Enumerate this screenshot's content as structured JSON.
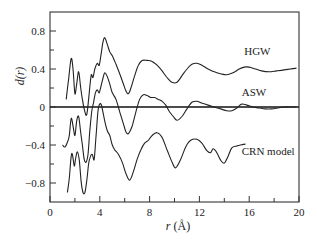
{
  "chart_data": {
    "type": "line",
    "title": "",
    "xlabel": "r (Å)",
    "ylabel": "d(r)",
    "xlim": [
      0,
      20
    ],
    "ylim": [
      -1.0,
      1.0
    ],
    "grid": false,
    "legend": "inline labels",
    "x_ticks": [
      0,
      4,
      8,
      12,
      16,
      20
    ],
    "x_tick_labels": [
      "0",
      "4",
      "8",
      "12",
      "16",
      "20"
    ],
    "x_minor_ticks": [
      2,
      6,
      10,
      14,
      18
    ],
    "y_ticks": [
      0.8,
      0.4,
      0,
      -0.4,
      -0.8
    ],
    "y_tick_labels": [
      "0.8",
      "0.4",
      "0",
      "−0.4",
      "−0.8"
    ],
    "y_minor_ticks": [
      0.6,
      0.2,
      -0.2,
      -0.6
    ],
    "zero_line": true,
    "series": [
      {
        "name": "HGW",
        "label_pos": [
          15.6,
          0.55
        ],
        "x": [
          1.3,
          1.5,
          1.7,
          1.85,
          2.0,
          2.15,
          2.3,
          2.45,
          2.6,
          2.8,
          2.95,
          3.1,
          3.3,
          3.45,
          3.6,
          3.8,
          3.95,
          4.1,
          4.25,
          4.4,
          4.6,
          4.8,
          5.0,
          5.3,
          5.6,
          5.9,
          6.1,
          6.3,
          6.5,
          6.8,
          7.1,
          7.4,
          7.8,
          8.2,
          8.6,
          9.0,
          9.4,
          9.8,
          10.2,
          10.6,
          11.0,
          11.4,
          11.8,
          12.2,
          12.7,
          13.2,
          13.7,
          14.2,
          14.7,
          15.2,
          15.6,
          16.0,
          16.5,
          17.0,
          17.6,
          18.2,
          18.8,
          19.3,
          19.8
        ],
        "values": [
          0.08,
          0.3,
          0.51,
          0.4,
          0.14,
          0.25,
          0.37,
          0.22,
          0.08,
          -0.05,
          -0.08,
          0.08,
          0.33,
          0.31,
          0.4,
          0.46,
          0.44,
          0.55,
          0.68,
          0.73,
          0.66,
          0.58,
          0.54,
          0.45,
          0.35,
          0.24,
          0.17,
          0.14,
          0.2,
          0.33,
          0.44,
          0.49,
          0.49,
          0.48,
          0.44,
          0.38,
          0.31,
          0.26,
          0.26,
          0.33,
          0.4,
          0.45,
          0.46,
          0.44,
          0.4,
          0.37,
          0.35,
          0.34,
          0.36,
          0.4,
          0.42,
          0.42,
          0.4,
          0.38,
          0.37,
          0.38,
          0.39,
          0.4,
          0.41
        ]
      },
      {
        "name": "ASW",
        "label_pos": [
          15.4,
          0.12
        ],
        "x": [
          1.0,
          1.2,
          1.4,
          1.55,
          1.7,
          1.85,
          2.0,
          2.15,
          2.3,
          2.45,
          2.6,
          2.75,
          2.9,
          3.05,
          3.2,
          3.35,
          3.5,
          3.65,
          3.8,
          3.95,
          4.1,
          4.25,
          4.4,
          4.6,
          4.8,
          5.0,
          5.3,
          5.6,
          5.9,
          6.1,
          6.3,
          6.6,
          6.9,
          7.2,
          7.5,
          7.8,
          8.1,
          8.4,
          8.7,
          9.0,
          9.3,
          9.6,
          9.9,
          10.2,
          10.6,
          11.0,
          11.4,
          11.8,
          12.2,
          12.7,
          13.2,
          13.7,
          14.2,
          14.6,
          15.0,
          15.4,
          15.8,
          16.3,
          16.8,
          17.3,
          17.8,
          18.3,
          18.8,
          19.3,
          19.8
        ],
        "values": [
          -0.4,
          -0.42,
          -0.37,
          -0.3,
          -0.12,
          -0.2,
          -0.3,
          -0.14,
          -0.1,
          -0.25,
          -0.4,
          -0.55,
          -0.58,
          -0.5,
          -0.25,
          -0.05,
          0.05,
          0.15,
          0.18,
          0.15,
          0.22,
          0.3,
          0.36,
          0.32,
          0.24,
          0.15,
          0.08,
          -0.05,
          -0.18,
          -0.26,
          -0.28,
          -0.2,
          -0.05,
          0.08,
          0.13,
          0.12,
          0.1,
          0.1,
          0.08,
          0.06,
          0.02,
          -0.05,
          -0.1,
          -0.14,
          -0.1,
          -0.02,
          0.05,
          0.06,
          0.04,
          0.02,
          0.0,
          -0.02,
          -0.04,
          -0.04,
          -0.01,
          0.03,
          0.02,
          0.0,
          -0.01,
          -0.02,
          -0.02,
          -0.01,
          0.0,
          0.0,
          0.0
        ]
      },
      {
        "name": "CRN model",
        "label_pos": [
          15.4,
          -0.5
        ],
        "x": [
          1.4,
          1.55,
          1.7,
          1.8,
          1.95,
          2.05,
          2.2,
          2.35,
          2.5,
          2.65,
          2.8,
          2.95,
          3.1,
          3.25,
          3.4,
          3.55,
          3.7,
          3.85,
          3.95,
          4.1,
          4.25,
          4.4,
          4.6,
          4.8,
          5.0,
          5.2,
          5.5,
          5.8,
          6.1,
          6.4,
          6.7,
          7.0,
          7.3,
          7.6,
          7.9,
          8.2,
          8.6,
          9.0,
          9.4,
          9.8,
          10.1,
          10.5,
          10.9,
          11.3,
          11.8,
          12.2,
          12.6,
          12.9,
          13.1,
          13.4,
          13.7,
          14.0,
          14.3,
          14.6,
          15.0,
          15.3,
          15.7
        ],
        "values": [
          -0.9,
          -0.75,
          -0.52,
          -0.5,
          -0.62,
          -0.55,
          -0.47,
          -0.56,
          -0.78,
          -0.9,
          -0.9,
          -0.78,
          -0.6,
          -0.52,
          -0.5,
          -0.55,
          -0.3,
          -0.05,
          0.02,
          0.03,
          -0.05,
          -0.15,
          -0.25,
          -0.3,
          -0.4,
          -0.45,
          -0.5,
          -0.58,
          -0.7,
          -0.77,
          -0.68,
          -0.55,
          -0.45,
          -0.38,
          -0.35,
          -0.3,
          -0.27,
          -0.32,
          -0.45,
          -0.58,
          -0.64,
          -0.55,
          -0.42,
          -0.35,
          -0.34,
          -0.38,
          -0.46,
          -0.48,
          -0.44,
          -0.48,
          -0.56,
          -0.59,
          -0.52,
          -0.43,
          -0.41,
          -0.4,
          -0.39
        ]
      }
    ]
  },
  "axes": {
    "xlabel_italic": "r",
    "xlabel_unit": "(Å)",
    "ylabel": "d(r)"
  }
}
